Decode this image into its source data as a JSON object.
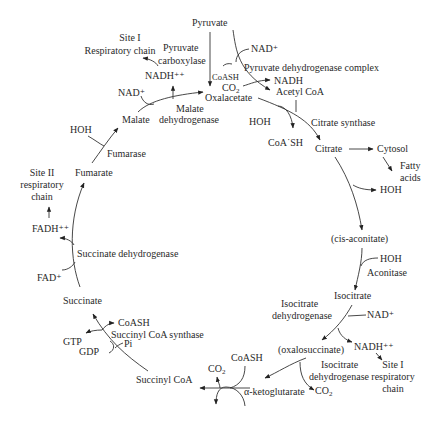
{
  "metabolites": {
    "pyruvate": "Pyruvate",
    "oxalacetate": "Oxalacetate",
    "acetyl_coa": "Acetyl CoA",
    "citrate": "Citrate",
    "cis_aconitate": "(cis-aconitate)",
    "isocitrate": "Isocitrate",
    "oxalosuccinate": "(oxalosuccinate)",
    "alpha_ketoglutarate": "α-ketoglutarate",
    "succinyl_coa": "Succinyl CoA",
    "succinate": "Succinate",
    "fumarate": "Fumarate",
    "malate": "Malate"
  },
  "enzymes": {
    "pyruvate_carboxylase": [
      "Pyruvate",
      "carboxylase"
    ],
    "pyruvate_dehydrogenase": "Pyruvate dehydrogenase complex",
    "citrate_synthase": "Citrate synthase",
    "aconitase": "Aconitase",
    "isocitrate_dh_1": [
      "Isocitrate",
      "dehydrogenase"
    ],
    "isocitrate_dh_2": [
      "Isocitrate",
      "dehydrogenase"
    ],
    "succinyl_coa_synthase": "Succinyl CoA synthase",
    "succinate_dh": "Succinate dehydrogenase",
    "fumarase": "Fumarase",
    "malate_dh": [
      "Malate",
      "dehydrogenase"
    ]
  },
  "cofactors": {
    "nad_top": "NAD⁺",
    "nadh_top": "NADH",
    "coash_top": "CoASH",
    "co2_top": "CO",
    "co2_sub": "2",
    "hoh_citrate": "HOH",
    "coash_citrate": "CoA˙SH",
    "cytosol": "Cytosol",
    "fatty_acids": [
      "Fatty",
      "acids"
    ],
    "hoh_citrate_out": "HOH",
    "hoh_aconitase": "HOH",
    "nad_isocitrate": "NAD⁺",
    "nadh_isocitrate": "NADH⁺⁺",
    "site1_right": [
      "Site I",
      "respiratory",
      "chain"
    ],
    "co2_isocitrate": "CO",
    "coash_bottom": "CoASH",
    "co2_bottom": "CO",
    "gtp": "GTP",
    "gdp": "GDP",
    "pi": "Pi",
    "coash_succinyl": "CoASH",
    "fad": "FAD⁺",
    "fadh": "FADH⁺⁺",
    "site2": [
      "Site II",
      "respiratory",
      "chain"
    ],
    "hoh_fumarase": "HOH",
    "nad_malate": "NAD⁺",
    "nadh_malate": "NADH⁺⁺",
    "site1_left": [
      "Site I",
      "Respiratory chain"
    ]
  }
}
